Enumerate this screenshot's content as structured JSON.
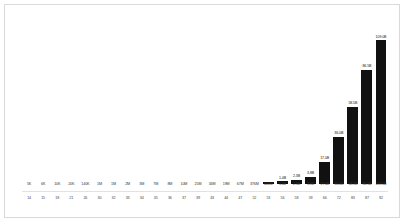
{
  "chart_data": {
    "type": "bar",
    "title": "",
    "subtitle": "",
    "xlabel": "",
    "ylabel": "",
    "grid": false,
    "legend": "none",
    "ylim": [
      0,
      120
    ],
    "categories": [
      "5K",
      "6K",
      "10K",
      "20K",
      "140K",
      "1M",
      "1M",
      "2M",
      "3M",
      "7M",
      "8M",
      "10M",
      "25M",
      "34M",
      "19M",
      "67M",
      "376M",
      "620M",
      "1.4B",
      "2.3B",
      "3.8B",
      "17.0B",
      "36.0B",
      "58.5B",
      "86.5B",
      "109.0B"
    ],
    "secondary_axis_label": "",
    "secondary_categories": [
      "14",
      "15",
      "18",
      "21",
      "26",
      "30",
      "32",
      "33",
      "34",
      "35",
      "36",
      "37",
      "39",
      "43",
      "44",
      "47",
      "52",
      "53",
      "56",
      "58",
      "59",
      "66",
      "72",
      "83",
      "87",
      "92"
    ],
    "values": [
      0.005,
      0.006,
      0.01,
      0.02,
      0.14,
      1,
      1,
      2,
      3,
      7,
      8,
      10,
      25,
      34,
      19,
      67,
      0.376,
      0.62,
      1.4,
      2.3,
      3.8,
      17.0,
      36.0,
      58.5,
      86.5,
      109.0
    ],
    "bar_heights": [
      0,
      0,
      0,
      0,
      0,
      0,
      0,
      0,
      0,
      0,
      0,
      0,
      0,
      0,
      0,
      0,
      0,
      1.2,
      2.0,
      3.2,
      5.2,
      17.0,
      36.0,
      58.5,
      86.5,
      109.0
    ],
    "data_labels": [
      "",
      "",
      "",
      "",
      "",
      "",
      "",
      "",
      "",
      "",
      "",
      "",
      "",
      "",
      "",
      "",
      "",
      "",
      "1.4B",
      "2.3B",
      "3.8B",
      "17.0B",
      "36.0B",
      "58.5B",
      "86.5B",
      "109.0B"
    ],
    "bar_color": "#111111",
    "frame_color": "#d9d9d9"
  }
}
